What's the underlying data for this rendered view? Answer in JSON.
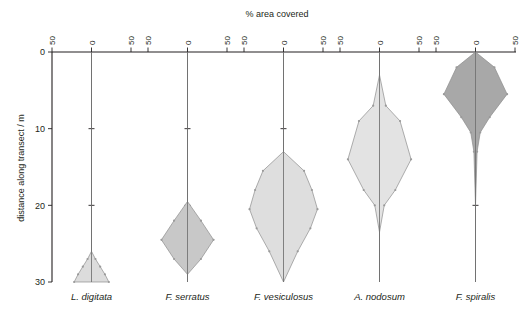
{
  "chart_data": {
    "type": "violin",
    "title": "",
    "xlabel": "% area covered",
    "ylabel": "distance along transect / m",
    "ylim": [
      0,
      30
    ],
    "y_ticks": [
      0,
      10,
      20,
      30
    ],
    "y_tick_labels": [
      "0",
      "10",
      "20",
      "30"
    ],
    "x_panel_ticks": [
      50,
      0,
      50
    ],
    "x_panel_tick_labels": [
      "50",
      "0",
      "50"
    ],
    "x_axis_max_per_side": 50,
    "grid": false,
    "legend": "none",
    "orientation": "vertical-inverted",
    "note": "Five side-by-side mirrored density (violin) panels; y axis increases downward from 0 m at top to 30 m at bottom.",
    "series": [
      {
        "name": "L. digitata",
        "fill": "#dcdcdc",
        "stroke": "#8d8d8d",
        "center_x_pct": 0,
        "range_m": [
          26.0,
          30.0
        ],
        "peak_m": 30.0,
        "peak_halfwidth_pct": 22,
        "profile": [
          {
            "m": 26.0,
            "halfwidth_pct": 0
          },
          {
            "m": 27.0,
            "halfwidth_pct": 5
          },
          {
            "m": 28.0,
            "halfwidth_pct": 11
          },
          {
            "m": 29.0,
            "halfwidth_pct": 17
          },
          {
            "m": 30.0,
            "halfwidth_pct": 22
          }
        ]
      },
      {
        "name": "F. serratus",
        "fill": "#c8c8c8",
        "stroke": "#8d8d8d",
        "center_x_pct": 0,
        "range_m": [
          19.5,
          29.0
        ],
        "peak_m": 24.5,
        "peak_halfwidth_pct": 33,
        "profile": [
          {
            "m": 19.5,
            "halfwidth_pct": 0
          },
          {
            "m": 22.0,
            "halfwidth_pct": 17
          },
          {
            "m": 24.5,
            "halfwidth_pct": 33
          },
          {
            "m": 27.0,
            "halfwidth_pct": 17
          },
          {
            "m": 29.0,
            "halfwidth_pct": 0
          }
        ]
      },
      {
        "name": "F. vesiculosus",
        "fill": "#dedede",
        "stroke": "#8d8d8d",
        "center_x_pct": 0,
        "range_m": [
          13.0,
          30.0
        ],
        "peak_m": 20.5,
        "peak_halfwidth_pct": 43,
        "profile": [
          {
            "m": 13.0,
            "halfwidth_pct": 0
          },
          {
            "m": 15.5,
            "halfwidth_pct": 26
          },
          {
            "m": 18.0,
            "halfwidth_pct": 36
          },
          {
            "m": 20.5,
            "halfwidth_pct": 43
          },
          {
            "m": 23.0,
            "halfwidth_pct": 34
          },
          {
            "m": 26.0,
            "halfwidth_pct": 18
          },
          {
            "m": 30.0,
            "halfwidth_pct": 0
          }
        ]
      },
      {
        "name": "A. nodosum",
        "fill": "#e3e3e3",
        "stroke": "#8d8d8d",
        "center_x_pct": 0,
        "range_m": [
          3.0,
          23.5
        ],
        "peak_m": 14.0,
        "peak_halfwidth_pct": 40,
        "profile": [
          {
            "m": 3.0,
            "halfwidth_pct": 0
          },
          {
            "m": 7.0,
            "halfwidth_pct": 8
          },
          {
            "m": 9.0,
            "halfwidth_pct": 26
          },
          {
            "m": 14.0,
            "halfwidth_pct": 40
          },
          {
            "m": 18.0,
            "halfwidth_pct": 20
          },
          {
            "m": 20.0,
            "halfwidth_pct": 6
          },
          {
            "m": 23.5,
            "halfwidth_pct": 0
          }
        ]
      },
      {
        "name": "F. spiralis",
        "fill": "#a8a8a8",
        "stroke": "#6d6d6d",
        "center_x_pct": 0,
        "range_m": [
          0.0,
          20.0
        ],
        "peak_m": 5.5,
        "peak_halfwidth_pct": 40,
        "profile": [
          {
            "m": 0.0,
            "halfwidth_pct": 0
          },
          {
            "m": 2.0,
            "halfwidth_pct": 24
          },
          {
            "m": 5.5,
            "halfwidth_pct": 40
          },
          {
            "m": 8.5,
            "halfwidth_pct": 18
          },
          {
            "m": 10.5,
            "halfwidth_pct": 6
          },
          {
            "m": 13.0,
            "halfwidth_pct": 2
          },
          {
            "m": 20.0,
            "halfwidth_pct": 0
          }
        ]
      }
    ]
  },
  "axes": {
    "x_title": "% area covered",
    "y_title": "distance along transect / m",
    "y_tick_labels": [
      "0",
      "10",
      "20",
      "30"
    ],
    "panel_tick_labels": [
      "50",
      "0",
      "50"
    ]
  },
  "species_labels": [
    "L. digitata",
    "F. serratus",
    "F. vesiculosus",
    "A. nodosum",
    "F. spiralis"
  ],
  "colors": {
    "axis": "#231f20",
    "center_line": "#6f6f6f",
    "background": "#ffffff",
    "violin_outline": "#8d8d8d"
  }
}
